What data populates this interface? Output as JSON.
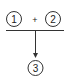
{
  "diagram": {
    "nodes": [
      {
        "id": "1",
        "label": "1"
      },
      {
        "id": "2",
        "label": "2"
      },
      {
        "id": "3",
        "label": "3"
      }
    ],
    "operator": "+",
    "edges": [
      {
        "from": "1+2",
        "to": "3"
      }
    ],
    "colors": {
      "stroke": "#333333",
      "background": "#ffffff"
    }
  }
}
